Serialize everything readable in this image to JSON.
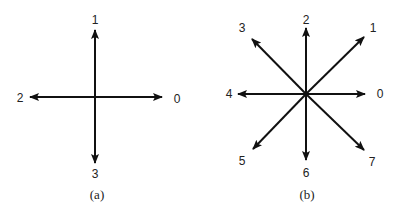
{
  "diagrams": [
    {
      "caption": "(a)",
      "labels": {
        "d0": "0",
        "d1": "1",
        "d2": "2",
        "d3": "3"
      }
    },
    {
      "caption": "(b)",
      "labels": {
        "d0": "0",
        "d1": "1",
        "d2": "2",
        "d3": "3",
        "d4": "4",
        "d5": "5",
        "d6": "6",
        "d7": "7"
      }
    }
  ]
}
